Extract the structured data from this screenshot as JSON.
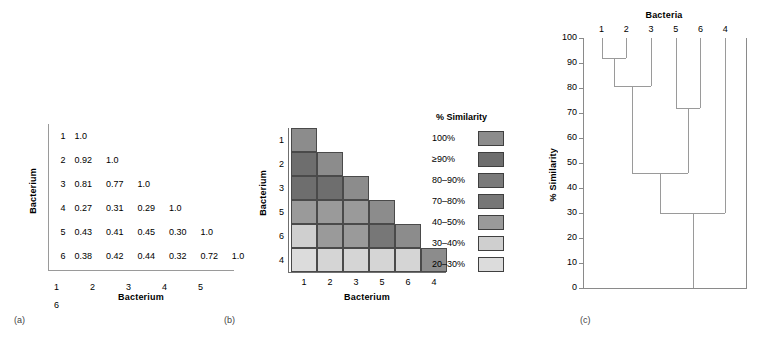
{
  "figure": {
    "panels": [
      {
        "id": "a",
        "label": "(a)"
      },
      {
        "id": "b",
        "label": "(b)"
      },
      {
        "id": "c",
        "label": "(c)"
      }
    ]
  },
  "panel_a": {
    "label": "(a)",
    "x_title": "Bacterium",
    "y_title": "Bacterium",
    "row_labels": [
      "1",
      "2",
      "3",
      "4",
      "5",
      "6"
    ],
    "col_labels": [
      "1",
      "2",
      "3",
      "4",
      "5",
      "6"
    ],
    "rows": [
      [
        "1.0"
      ],
      [
        "0.92",
        "1.0"
      ],
      [
        "0.81",
        "0.77",
        "1.0"
      ],
      [
        "0.27",
        "0.31",
        "0.29",
        "1.0"
      ],
      [
        "0.43",
        "0.41",
        "0.45",
        "0.30",
        "1.0"
      ],
      [
        "0.38",
        "0.42",
        "0.44",
        "0.32",
        "0.72",
        "1.0"
      ]
    ]
  },
  "panel_b": {
    "label": "(b)",
    "x_title": "Bacterium",
    "y_title": "Bacterium",
    "row_labels": [
      "1",
      "2",
      "3",
      "5",
      "6",
      "4"
    ],
    "col_labels": [
      "1",
      "2",
      "3",
      "5",
      "6",
      "4"
    ],
    "rows": [
      [
        "#8c8c8c"
      ],
      [
        "#6e6e6e",
        "#8c8c8c"
      ],
      [
        "#6e6e6e",
        "#6e6e6e",
        "#8c8c8c"
      ],
      [
        "#9a9a9a",
        "#9a9a9a",
        "#9a9a9a",
        "#8c8c8c"
      ],
      [
        "#cfcfcf",
        "#9a9a9a",
        "#9a9a9a",
        "#777777",
        "#8c8c8c"
      ],
      [
        "#dcdcdc",
        "#d5d5d5",
        "#d5d5d5",
        "#d5d5d5",
        "#d5d5d5",
        "#8c8c8c"
      ]
    ]
  },
  "legend": {
    "title": "% Similarity",
    "items": [
      {
        "label": "100%",
        "color": "#8c8c8c"
      },
      {
        "label": "≥90%",
        "color": "#6e6e6e"
      },
      {
        "label": "80–90%",
        "color": "#7a7a7a"
      },
      {
        "label": "70–80%",
        "color": "#777777"
      },
      {
        "label": "40–50%",
        "color": "#9a9a9a"
      },
      {
        "label": "30–40%",
        "color": "#cfcfcf"
      },
      {
        "label": "20–30%",
        "color": "#dcdcdc"
      }
    ]
  },
  "panel_c": {
    "label": "(c)",
    "title": "Bacteria",
    "y_title": "% Similarity"
  },
  "chart_data": {
    "type": "line",
    "chart_kind": "dendrogram",
    "title": "Bacteria",
    "xlabel": "Bacteria",
    "ylabel": "% Similarity",
    "ylim": [
      0,
      100
    ],
    "y_inverted": true,
    "grid": false,
    "legend_position": "none",
    "yticks": [
      100,
      90,
      80,
      70,
      60,
      50,
      40,
      30,
      20,
      10,
      0
    ],
    "leaf_order": [
      "1",
      "2",
      "3",
      "5",
      "6",
      "4"
    ],
    "merges": [
      {
        "clusters": [
          "1",
          "2"
        ],
        "similarity": 92
      },
      {
        "clusters": [
          "1,2",
          "3"
        ],
        "similarity": 81
      },
      {
        "clusters": [
          "5",
          "6"
        ],
        "similarity": 72
      },
      {
        "clusters": [
          "1,2,3",
          "5,6"
        ],
        "similarity": 46
      },
      {
        "clusters": [
          "1,2,3,5,6",
          "4"
        ],
        "similarity": 30
      }
    ],
    "source_matrix": {
      "labels": [
        "1",
        "2",
        "3",
        "4",
        "5",
        "6"
      ],
      "values": [
        [
          1.0,
          null,
          null,
          null,
          null,
          null
        ],
        [
          0.92,
          1.0,
          null,
          null,
          null,
          null
        ],
        [
          0.81,
          0.77,
          1.0,
          null,
          null,
          null
        ],
        [
          0.27,
          0.31,
          0.29,
          1.0,
          null,
          null
        ],
        [
          0.43,
          0.41,
          0.45,
          0.3,
          1.0,
          null
        ],
        [
          0.38,
          0.42,
          0.44,
          0.32,
          0.72,
          1.0
        ]
      ]
    }
  }
}
